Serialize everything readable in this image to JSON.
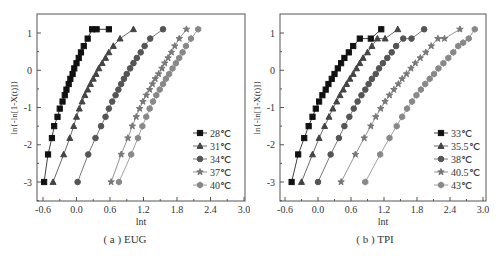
{
  "figure": {
    "panels": [
      {
        "id": "a",
        "caption": "( a ) EUG"
      },
      {
        "id": "b",
        "caption": "( b ) TPI"
      }
    ]
  },
  "chart_data": [
    {
      "type": "line",
      "title": "( a ) EUG",
      "xlabel": "lnt",
      "ylabel": "ln{-ln[1-X(t)]}",
      "xlim": [
        -0.72,
        3.0
      ],
      "ylim": [
        -3.5,
        1.45
      ],
      "xticks": [
        "-0.6",
        "0.0",
        "0.6",
        "1.2",
        "1.8",
        "2.4",
        "3.0"
      ],
      "xtick_values": [
        -0.6,
        0.0,
        0.6,
        1.2,
        1.8,
        2.4,
        3.0
      ],
      "yticks": [
        "1",
        "0",
        "-1",
        "-2",
        "-3"
      ],
      "ytick_values": [
        1,
        0,
        -1,
        -2,
        -3
      ],
      "grid": false,
      "legend_position": "lower right",
      "series": [
        {
          "name": "28℃",
          "marker": "square",
          "color": "#111111",
          "x": [
            -0.58,
            -0.51,
            -0.44,
            -0.4,
            -0.34,
            -0.3,
            -0.25,
            -0.21,
            -0.18,
            -0.14,
            -0.11,
            -0.07,
            -0.04,
            0.0,
            0.04,
            0.08,
            0.13,
            0.2,
            0.28,
            0.36,
            0.58
          ],
          "y": [
            -3.0,
            -2.26,
            -1.82,
            -1.5,
            -1.25,
            -1.03,
            -0.84,
            -0.67,
            -0.52,
            -0.37,
            -0.23,
            -0.1,
            0.05,
            0.19,
            0.33,
            0.48,
            0.65,
            0.85,
            1.1,
            1.1,
            1.1
          ]
        },
        {
          "name": "31℃",
          "marker": "triangle",
          "color": "#444444",
          "x": [
            -0.42,
            -0.23,
            -0.12,
            -0.05,
            0.0,
            0.05,
            0.1,
            0.15,
            0.2,
            0.25,
            0.3,
            0.35,
            0.4,
            0.46,
            0.52,
            0.58,
            0.66,
            0.78,
            1.02
          ],
          "y": [
            -3.0,
            -2.26,
            -1.82,
            -1.5,
            -1.25,
            -1.03,
            -0.84,
            -0.67,
            -0.52,
            -0.37,
            -0.23,
            -0.1,
            0.05,
            0.19,
            0.33,
            0.48,
            0.65,
            0.85,
            1.1
          ]
        },
        {
          "name": "34℃",
          "marker": "circle",
          "color": "#555555",
          "x": [
            0.02,
            0.21,
            0.34,
            0.44,
            0.52,
            0.58,
            0.64,
            0.7,
            0.75,
            0.8,
            0.85,
            0.9,
            0.96,
            1.02,
            1.08,
            1.15,
            1.22,
            1.32,
            1.55
          ],
          "y": [
            -3.0,
            -2.26,
            -1.82,
            -1.5,
            -1.25,
            -1.03,
            -0.84,
            -0.67,
            -0.52,
            -0.37,
            -0.23,
            -0.1,
            0.05,
            0.19,
            0.33,
            0.48,
            0.65,
            0.85,
            1.1
          ]
        },
        {
          "name": "37℃",
          "marker": "star",
          "color": "#777777",
          "x": [
            0.62,
            0.8,
            0.92,
            1.0,
            1.07,
            1.13,
            1.19,
            1.25,
            1.31,
            1.36,
            1.41,
            1.47,
            1.53,
            1.58,
            1.64,
            1.7,
            1.76,
            1.84,
            1.97
          ],
          "y": [
            -3.0,
            -2.26,
            -1.82,
            -1.5,
            -1.25,
            -1.03,
            -0.84,
            -0.67,
            -0.52,
            -0.37,
            -0.23,
            -0.1,
            0.05,
            0.19,
            0.33,
            0.48,
            0.65,
            0.85,
            1.1
          ]
        },
        {
          "name": "40℃",
          "marker": "hexagon",
          "color": "#888888",
          "x": [
            0.76,
            0.98,
            1.1,
            1.18,
            1.25,
            1.31,
            1.37,
            1.43,
            1.49,
            1.55,
            1.6,
            1.66,
            1.72,
            1.78,
            1.84,
            1.9,
            1.96,
            2.05,
            2.18
          ],
          "y": [
            -3.0,
            -2.26,
            -1.82,
            -1.5,
            -1.25,
            -1.03,
            -0.84,
            -0.67,
            -0.52,
            -0.37,
            -0.23,
            -0.1,
            0.05,
            0.19,
            0.33,
            0.48,
            0.65,
            0.85,
            1.1
          ]
        }
      ]
    },
    {
      "type": "line",
      "title": "( b ) TPI",
      "xlabel": "lnt",
      "ylabel": "ln{-ln[1-X(t)]}",
      "xlim": [
        -0.72,
        3.0
      ],
      "ylim": [
        -3.5,
        1.45
      ],
      "xticks": [
        "-0.6",
        "0.0",
        "0.6",
        "1.2",
        "1.8",
        "2.4",
        "3.0"
      ],
      "xtick_values": [
        -0.6,
        0.0,
        0.6,
        1.2,
        1.8,
        2.4,
        3.0
      ],
      "yticks": [
        "1",
        "0",
        "-1",
        "-2",
        "-3"
      ],
      "ytick_values": [
        1,
        0,
        -1,
        -2,
        -3
      ],
      "grid": false,
      "legend_position": "lower right",
      "series": [
        {
          "name": "33℃",
          "marker": "square",
          "color": "#111111",
          "x": [
            -0.48,
            -0.36,
            -0.25,
            -0.17,
            -0.1,
            -0.04,
            0.02,
            0.08,
            0.14,
            0.19,
            0.25,
            0.3,
            0.36,
            0.42,
            0.48,
            0.56,
            0.64,
            0.76,
            0.96,
            1.15
          ],
          "y": [
            -3.0,
            -2.26,
            -1.82,
            -1.5,
            -1.25,
            -1.03,
            -0.84,
            -0.67,
            -0.52,
            -0.37,
            -0.23,
            -0.1,
            0.05,
            0.19,
            0.33,
            0.48,
            0.65,
            0.85,
            0.85,
            1.1
          ]
        },
        {
          "name": "35.5℃",
          "marker": "triangle",
          "color": "#444444",
          "x": [
            -0.3,
            -0.1,
            0.02,
            0.12,
            0.2,
            0.27,
            0.34,
            0.4,
            0.46,
            0.52,
            0.58,
            0.64,
            0.7,
            0.76,
            0.82,
            0.9,
            0.98,
            1.08,
            1.22,
            1.45
          ],
          "y": [
            -3.0,
            -2.26,
            -1.82,
            -1.5,
            -1.25,
            -1.03,
            -0.84,
            -0.67,
            -0.52,
            -0.37,
            -0.23,
            -0.1,
            0.05,
            0.19,
            0.33,
            0.48,
            0.65,
            0.85,
            0.85,
            1.1
          ]
        },
        {
          "name": "38℃",
          "marker": "circle",
          "color": "#555555",
          "x": [
            0.0,
            0.23,
            0.38,
            0.48,
            0.57,
            0.65,
            0.72,
            0.79,
            0.86,
            0.92,
            0.98,
            1.05,
            1.11,
            1.18,
            1.26,
            1.34,
            1.42,
            1.55,
            1.7,
            1.93
          ],
          "y": [
            -3.0,
            -2.26,
            -1.82,
            -1.5,
            -1.25,
            -1.03,
            -0.84,
            -0.67,
            -0.52,
            -0.37,
            -0.23,
            -0.1,
            0.05,
            0.19,
            0.33,
            0.48,
            0.65,
            0.85,
            0.85,
            1.1
          ]
        },
        {
          "name": "40.5℃",
          "marker": "star",
          "color": "#777777",
          "x": [
            0.42,
            0.68,
            0.84,
            0.96,
            1.05,
            1.14,
            1.22,
            1.3,
            1.38,
            1.46,
            1.53,
            1.61,
            1.69,
            1.77,
            1.86,
            1.96,
            2.06,
            2.18,
            2.3,
            2.58
          ],
          "y": [
            -3.0,
            -2.26,
            -1.82,
            -1.5,
            -1.25,
            -1.03,
            -0.84,
            -0.67,
            -0.52,
            -0.37,
            -0.23,
            -0.1,
            0.05,
            0.19,
            0.33,
            0.48,
            0.65,
            0.85,
            0.85,
            1.1
          ]
        },
        {
          "name": "43℃",
          "marker": "hexagon",
          "color": "#888888",
          "x": [
            0.86,
            1.13,
            1.3,
            1.43,
            1.53,
            1.62,
            1.71,
            1.79,
            1.87,
            1.95,
            2.03,
            2.11,
            2.19,
            2.28,
            2.37,
            2.46,
            2.55,
            2.64,
            2.74,
            2.85
          ],
          "y": [
            -3.0,
            -2.26,
            -1.82,
            -1.5,
            -1.25,
            -1.03,
            -0.84,
            -0.67,
            -0.52,
            -0.37,
            -0.23,
            -0.1,
            0.05,
            0.19,
            0.33,
            0.48,
            0.65,
            0.74,
            0.85,
            1.1
          ]
        }
      ]
    }
  ]
}
